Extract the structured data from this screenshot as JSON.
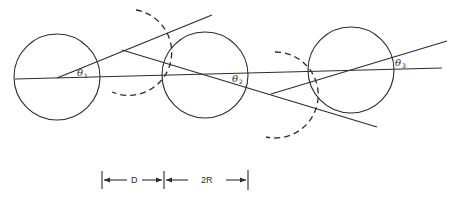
{
  "diagram": {
    "circles": [
      {
        "id": "sphere-1",
        "cx": 57,
        "cy": 77,
        "r": 43
      },
      {
        "id": "sphere-2",
        "cx": 205,
        "cy": 75,
        "r": 43
      },
      {
        "id": "sphere-3",
        "cx": 351,
        "cy": 70,
        "r": 43
      }
    ],
    "dashed_arcs": [
      {
        "id": "arc-1",
        "cx": 122,
        "cy": 50,
        "r": 43
      },
      {
        "id": "arc-2",
        "cx": 271,
        "cy": 94,
        "r": 43
      }
    ],
    "angle_labels": [
      {
        "symbol": "θ",
        "sub": "1"
      },
      {
        "symbol": "θ",
        "sub": "2"
      },
      {
        "symbol": "θ",
        "sub": "3"
      }
    ],
    "dimensions": {
      "gap_label": "D",
      "diameter_label": "2R"
    }
  }
}
